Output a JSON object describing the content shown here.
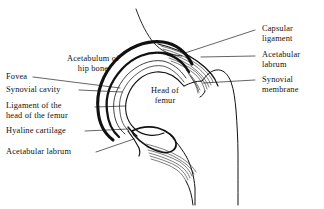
{
  "figure": {
    "background_color": "#ffffff",
    "line_color": "#111111"
  },
  "labels": {
    "acetabulum_of_hip_bone": "Acetabulum of\nhip bone",
    "fovea": "Fovea",
    "synovial_cavity": "Synovial cavity",
    "ligament_of_head_of_femur": "Ligament of the\nhead of the femur",
    "hyaline_cartilage": "Hyaline cartilage",
    "acetabular_labrum_left": "Acetabular labrum",
    "head_of_femur": "Head of\nfemur",
    "capsular_ligament": "Capsular\nligament",
    "acetabular_labrum_right": "Acetabular\nlabrum",
    "synovial_membrane": "Synovial\nmembrane"
  }
}
